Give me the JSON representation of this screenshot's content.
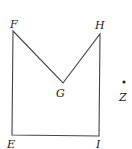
{
  "diagram": {
    "type": "geometry-figure",
    "points": {
      "F": {
        "label": "F",
        "x": 13,
        "y": 31
      },
      "H": {
        "label": "H",
        "x": 100,
        "y": 34
      },
      "G": {
        "label": "G",
        "x": 63,
        "y": 83
      },
      "E": {
        "label": "E",
        "x": 12,
        "y": 135
      },
      "I": {
        "label": "I",
        "x": 99,
        "y": 136
      },
      "Z": {
        "label": "Z",
        "x": 124,
        "y": 82
      }
    },
    "polygon": [
      "F",
      "G",
      "H",
      "I",
      "E"
    ],
    "line_color": "#444444"
  }
}
